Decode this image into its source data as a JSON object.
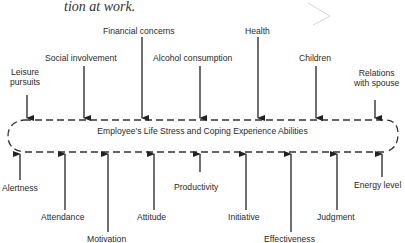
{
  "caption": "tion at work.",
  "center_label": "Employee's Life Stress and Coping Experience Abilities",
  "inputs": [
    {
      "label": "Leisure pursuits",
      "line1": "Leisure",
      "line2": "pursuits"
    },
    {
      "label": "Social involvement"
    },
    {
      "label": "Financial concerns"
    },
    {
      "label": "Alcohol consumption"
    },
    {
      "label": "Health"
    },
    {
      "label": "Children"
    },
    {
      "label": "Relations with spouse",
      "line1": "Relations",
      "line2": "with spouse"
    }
  ],
  "outputs": [
    {
      "label": "Alertness"
    },
    {
      "label": "Attendance"
    },
    {
      "label": "Motivation"
    },
    {
      "label": "Attitude"
    },
    {
      "label": "Productivity"
    },
    {
      "label": "Initiative"
    },
    {
      "label": "Effectiveness"
    },
    {
      "label": "Judgment"
    },
    {
      "label": "Energy level"
    }
  ]
}
